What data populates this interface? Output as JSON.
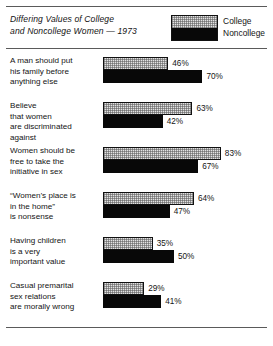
{
  "title": "Differing Values of College and Noncollege Women — 1973",
  "title_line1": "Differing Values of College",
  "title_line2": "and Noncollege Women — 1973",
  "legend": {
    "college": "College",
    "noncollege": "Noncollege"
  },
  "colors": {
    "college": "#e2e2e2",
    "noncollege": "#080808",
    "outline": "#111111",
    "rule": "#5a5a5a",
    "text": "#141414",
    "background": "#ffffff"
  },
  "chart_data": {
    "type": "bar",
    "orientation": "horizontal",
    "title": "Differing Values of College and Noncollege Women — 1973",
    "xlabel": "",
    "ylabel": "",
    "xlim": [
      0,
      100
    ],
    "grid": false,
    "legend_position": "top-right",
    "value_suffix": "%",
    "categories": [
      "A man should put his family before anything else",
      "Believe that women are discriminated against",
      "Women should be free to take the initiative in sex",
      "“Women’s place is in the home” is nonsense",
      "Having children is a very important value",
      "Casual premarital sex relations are morally wrong"
    ],
    "series": [
      {
        "name": "College",
        "values": [
          46,
          63,
          83,
          64,
          35,
          29
        ]
      },
      {
        "name": "Noncollege",
        "values": [
          70,
          42,
          67,
          47,
          50,
          41
        ]
      }
    ]
  },
  "groups": [
    {
      "label_lines": [
        "A man should put",
        "his family before",
        "anything else"
      ],
      "college": {
        "value": 46,
        "text": "46%"
      },
      "noncollege": {
        "value": 70,
        "text": "70%"
      }
    },
    {
      "label_lines": [
        "Believe",
        "that women",
        "are discriminated",
        "against"
      ],
      "college": {
        "value": 63,
        "text": "63%"
      },
      "noncollege": {
        "value": 42,
        "text": "42%"
      }
    },
    {
      "label_lines": [
        "Women should be",
        "free to take the",
        "initiative in sex"
      ],
      "college": {
        "value": 83,
        "text": "83%"
      },
      "noncollege": {
        "value": 67,
        "text": "67%"
      }
    },
    {
      "label_lines": [
        "“Women’s place is",
        "in the home”",
        "is nonsense"
      ],
      "college": {
        "value": 64,
        "text": "64%"
      },
      "noncollege": {
        "value": 47,
        "text": "47%"
      }
    },
    {
      "label_lines": [
        "Having children",
        "is a very",
        "important value"
      ],
      "college": {
        "value": 35,
        "text": "35%"
      },
      "noncollege": {
        "value": 50,
        "text": "50%"
      }
    },
    {
      "label_lines": [
        "Casual premarital",
        "sex relations",
        "are morally wrong"
      ],
      "college": {
        "value": 29,
        "text": "29%"
      },
      "noncollege": {
        "value": 41,
        "text": "41%"
      }
    }
  ]
}
